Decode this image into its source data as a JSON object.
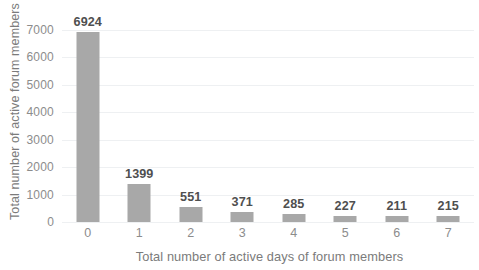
{
  "chart_data": {
    "type": "bar",
    "title": "",
    "subtitle": "",
    "xlabel": "Total number of active days of forum members",
    "ylabel": "Total number of active forum members",
    "categories": [
      "0",
      "1",
      "2",
      "3",
      "4",
      "5",
      "6",
      "7"
    ],
    "values": [
      6924,
      1399,
      551,
      371,
      285,
      227,
      211,
      215
    ],
    "data_labels": [
      "6924",
      "1399",
      "551",
      "371",
      "285",
      "227",
      "211",
      "215"
    ],
    "series": [
      {
        "name": "Total number of active forum members",
        "values": [
          6924,
          1399,
          551,
          371,
          285,
          227,
          211,
          215
        ],
        "color": "#a8a8a8"
      }
    ],
    "ylim": [
      0,
      7000
    ],
    "ytick_values": [
      0,
      1000,
      2000,
      3000,
      4000,
      5000,
      6000,
      7000
    ],
    "ytick_labels": [
      "0",
      "1000",
      "2000",
      "3000",
      "4000",
      "5000",
      "6000",
      "7000"
    ],
    "xtick_labels": [
      "0",
      "1",
      "2",
      "3",
      "4",
      "5",
      "6",
      "7"
    ],
    "grid": true,
    "grid_axis": "y",
    "grid_color": "#eef0f2",
    "legend": false,
    "legend_position": "none",
    "background_color": "#ffffff",
    "label_color": "#8c8c8c",
    "data_label_color": "#4f4f4f"
  }
}
